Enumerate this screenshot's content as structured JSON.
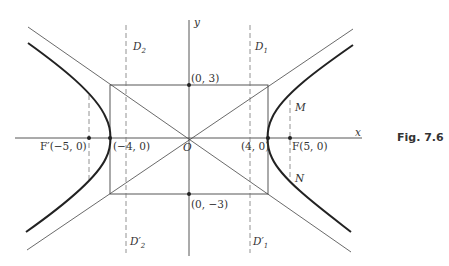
{
  "figure": {
    "caption": "Fig. 7.6",
    "axes": {
      "x_label": "x",
      "y_label": "y",
      "origin_label": "O"
    },
    "points": {
      "vertex_top": "(0, 3)",
      "vertex_bottom": "(0, −3)",
      "vertex_left": "(−4, 0)",
      "vertex_right": "(4, 0)",
      "focus_left": "F′(−5, 0)",
      "focus_right": "F(5, 0)",
      "M": "M",
      "N": "N"
    },
    "directrices": {
      "D1": "D",
      "D1_sub": "1",
      "D2": "D",
      "D2_sub": "2",
      "D1p": "D′",
      "D1p_sub": "1",
      "D2p": "D′",
      "D2p_sub": "2"
    },
    "curve": {
      "type": "hyperbola",
      "a": 4,
      "b": 3,
      "c": 5
    }
  }
}
